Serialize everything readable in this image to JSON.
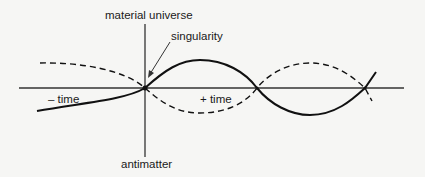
{
  "diagram": {
    "type": "wave-diagram",
    "labels": {
      "top_axis": "material universe",
      "bottom_axis": "antimatter",
      "singularity": "singularity",
      "negative_time": "– time",
      "positive_time": "+ time"
    },
    "colors": {
      "background": "#f6f6f4",
      "ink": "#111111",
      "axis": "#333333"
    }
  }
}
